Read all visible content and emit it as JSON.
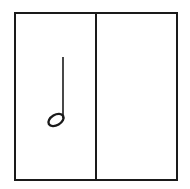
{
  "diagram": {
    "type": "music-notation-measure",
    "cells": [
      {
        "position": "left",
        "content": "half-note"
      },
      {
        "position": "right",
        "content": "empty"
      }
    ],
    "colors": {
      "line": "#1a1a1a",
      "background": "#ffffff"
    }
  }
}
